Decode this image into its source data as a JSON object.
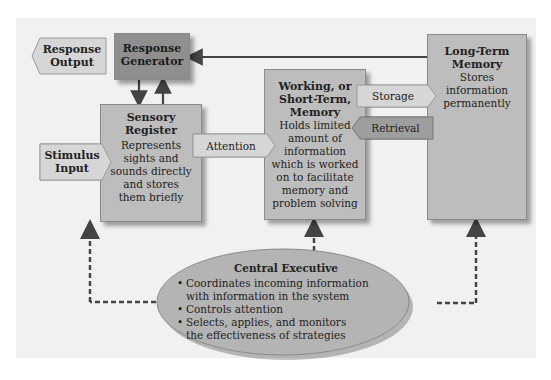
{
  "colors": {
    "background": "#f1f1f1",
    "box_light": "#bdbdbd",
    "box_dark": "#8f8f8f",
    "tag_light": "#d6d6d6",
    "ellipse": "#b4b4b4",
    "line": "#444444"
  },
  "nodes": {
    "response_output": {
      "title_line1": "Response",
      "title_line2": "Output"
    },
    "response_generator": {
      "title_line1": "Response",
      "title_line2": "Generator"
    },
    "stimulus_input": {
      "title_line1": "Stimulus",
      "title_line2": "Input"
    },
    "sensory_register": {
      "title_line1": "Sensory",
      "title_line2": "Register",
      "description": [
        "Represents",
        "sights and",
        "sounds directly",
        "and stores",
        "them briefly"
      ]
    },
    "working_memory": {
      "title_line1": "Working, or",
      "title_line2": "Short-Term,",
      "title_line3": "Memory",
      "description": [
        "Holds limited",
        "amount of",
        "information",
        "which is worked",
        "on to facilitate",
        "memory and",
        "problem solving"
      ]
    },
    "long_term_memory": {
      "title_line1": "Long-Term",
      "title_line2": "Memory",
      "description": [
        "Stores",
        "information",
        "permanently"
      ]
    },
    "central_executive": {
      "title": "Central Executive",
      "bullets": [
        {
          "line1": "Coordinates incoming information",
          "line2": "with information in the system"
        },
        {
          "line1": "Controls attention",
          "line2": ""
        },
        {
          "line1": "Selects, applies, and monitors",
          "line2": "the effectiveness of strategies"
        }
      ]
    }
  },
  "edges": {
    "attention": "Attention",
    "storage": "Storage",
    "retrieval": "Retrieval"
  }
}
